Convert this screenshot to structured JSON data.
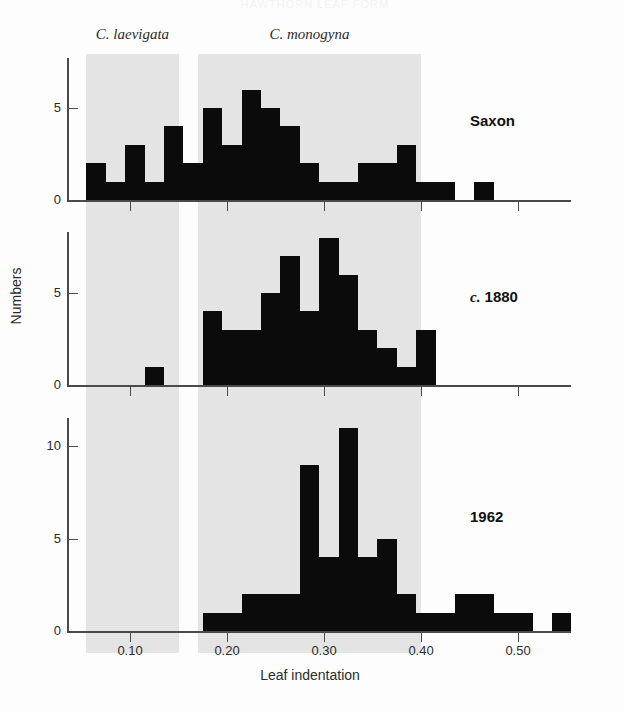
{
  "figure": {
    "cutoff_header": "HAWTHORN LEAF FORM",
    "xlabel": "Leaf indentation",
    "ylabel": "Numbers",
    "xtick_labels": [
      "0.10",
      "0.20",
      "0.30",
      "0.40",
      "0.50"
    ],
    "bands": [
      {
        "name": "C. laevigata",
        "label": "C. laevigata",
        "x_start": 0.055,
        "x_end": 0.15,
        "color": "#e4e4e4"
      },
      {
        "name": "C. monogyna",
        "label": "C. monogyna",
        "x_start": 0.17,
        "x_end": 0.4,
        "color": "#e4e4e4"
      }
    ],
    "bar_color": "#0b0b0b",
    "axis_color": "#4a4a4a"
  },
  "chart_data": {
    "type": "bar",
    "xlabel": "Leaf indentation",
    "ylabel": "Numbers",
    "xlim": [
      0.035,
      0.555
    ],
    "bin_width": 0.02,
    "grid": false,
    "legend": "none",
    "annotations": [
      "C. laevigata band spans 0.055-0.150",
      "C. monogyna band spans 0.170-0.400"
    ],
    "panels": [
      {
        "name": "Saxon",
        "label": "Saxon",
        "ylim": [
          0,
          7
        ],
        "yticks": [
          0,
          5
        ],
        "ytick_labels": [
          "0",
          "5"
        ],
        "bin_starts": [
          0.055,
          0.075,
          0.095,
          0.115,
          0.135,
          0.155,
          0.175,
          0.195,
          0.215,
          0.235,
          0.255,
          0.275,
          0.295,
          0.315,
          0.335,
          0.355,
          0.375,
          0.395,
          0.415,
          0.435,
          0.455,
          0.475
        ],
        "values": [
          2,
          1,
          3,
          1,
          4,
          2,
          5,
          3,
          6,
          5,
          4,
          2,
          1,
          1,
          2,
          2,
          3,
          1,
          1,
          0,
          1,
          0
        ]
      },
      {
        "name": "c. 1880",
        "label": "c. 1880",
        "ylim": [
          0,
          9
        ],
        "yticks": [
          0,
          5
        ],
        "ytick_labels": [
          "0",
          "5"
        ],
        "bin_starts": [
          0.115,
          0.175,
          0.195,
          0.215,
          0.235,
          0.255,
          0.275,
          0.295,
          0.315,
          0.335,
          0.355,
          0.375,
          0.395
        ],
        "values": [
          1,
          4,
          3,
          3,
          5,
          7,
          4,
          8,
          6,
          3,
          2,
          1,
          3
        ]
      },
      {
        "name": "1962",
        "label": "1962",
        "ylim": [
          0,
          12
        ],
        "yticks": [
          0,
          5,
          10
        ],
        "ytick_labels": [
          "0",
          "5",
          "10"
        ],
        "bin_starts": [
          0.175,
          0.195,
          0.215,
          0.235,
          0.255,
          0.275,
          0.295,
          0.315,
          0.335,
          0.355,
          0.375,
          0.395,
          0.415,
          0.435,
          0.455,
          0.475,
          0.495,
          0.515,
          0.535
        ],
        "values": [
          1,
          1,
          2,
          2,
          2,
          9,
          4,
          11,
          4,
          5,
          2,
          1,
          1,
          2,
          2,
          1,
          1,
          0,
          1
        ]
      }
    ]
  }
}
